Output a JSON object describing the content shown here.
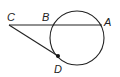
{
  "diagram": {
    "type": "circle-secant-tangent",
    "labels": {
      "C": "C",
      "B": "B",
      "A": "A",
      "D": "D"
    },
    "stroke_color": "#222222"
  }
}
